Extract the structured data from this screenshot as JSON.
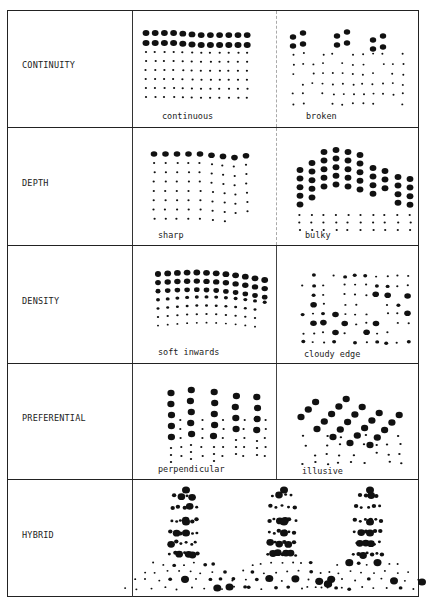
{
  "colors": {
    "ink": "#111111",
    "paper": "#ffffff",
    "rule": "#222222"
  },
  "rows": [
    {
      "id": "continuity",
      "label": "CONTINUITY",
      "examples": [
        {
          "label": "continuous",
          "pattern": "continuous"
        },
        {
          "label": "broken",
          "pattern": "broken"
        }
      ]
    },
    {
      "id": "depth",
      "label": "DEPTH",
      "examples": [
        {
          "label": "sharp",
          "pattern": "sharp"
        },
        {
          "label": "bulky",
          "pattern": "bulky"
        }
      ]
    },
    {
      "id": "density",
      "label": "DENSITY",
      "examples": [
        {
          "label": "soft inwards",
          "pattern": "soft-inwards"
        },
        {
          "label": "cloudy edge",
          "pattern": "cloudy-edge"
        }
      ]
    },
    {
      "id": "preferential",
      "label": "PREFERENTIAL",
      "examples": [
        {
          "label": "perpendicular",
          "pattern": "perpendicular"
        },
        {
          "label": "illusive",
          "pattern": "illusive"
        }
      ]
    },
    {
      "id": "hybrid",
      "label": "HYBRID",
      "examples": []
    }
  ]
}
